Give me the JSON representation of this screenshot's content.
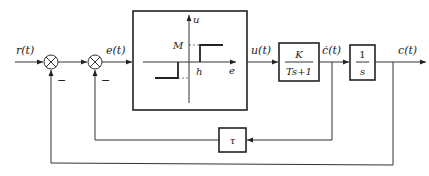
{
  "diagram": {
    "type": "control-system block diagram",
    "signals": {
      "input": "r(t)",
      "error": "e(t)",
      "relay_output": "u(t)",
      "velocity": "ċ(t)",
      "output": "c(t)"
    },
    "summing_junctions": [
      {
        "id": "sum1",
        "inputs": [
          "r(t)",
          "c(t)"
        ],
        "minus_sign": "−"
      },
      {
        "id": "sum2",
        "inputs": [
          "sum1 output",
          "τ·ċ(t)"
        ],
        "minus_sign": "−"
      }
    ],
    "relay_block": {
      "axis_u": "u",
      "axis_e": "e",
      "level_label": "M",
      "deadzone_label": "h"
    },
    "plant_block": {
      "numerator": "K",
      "denominator": "Ts+1"
    },
    "integrator_block": {
      "numerator": "1",
      "denominator": "s"
    },
    "feedback_block": {
      "label": "τ"
    },
    "minus_signs": [
      "−",
      "−"
    ]
  }
}
